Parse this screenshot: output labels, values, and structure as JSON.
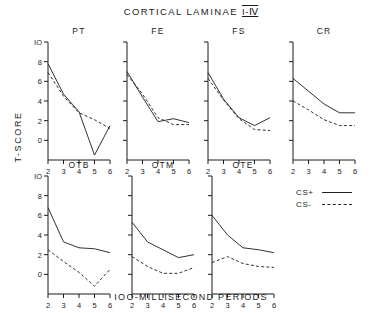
{
  "figure": {
    "title_main": "CORTICAL LAMINAE",
    "title_roman": "I-Ⅳ",
    "ylabel": "T-SCORE",
    "xlabel": "IOO-MILLISECOND PERIODS"
  },
  "legend": {
    "position": "right-middle",
    "entries": [
      {
        "key": "CS+",
        "style": "solid"
      },
      {
        "key": "CS-",
        "style": "dashed"
      }
    ]
  },
  "chart_data": {
    "type": "line",
    "xlabel": "IOO-MILLISECOND PERIODS",
    "ylabel": "T-SCORE",
    "x": [
      2,
      3,
      4,
      5,
      6
    ],
    "xticks": [
      "2",
      "3",
      "4",
      "5",
      "6"
    ],
    "xlim": [
      2,
      6
    ],
    "yticks": [
      "0",
      "2",
      "4",
      "6",
      "8",
      "IO"
    ],
    "ytick_values": [
      0,
      2,
      4,
      6,
      8,
      10
    ],
    "ylim": [
      -2,
      10
    ],
    "grid": false,
    "legend": [
      "CS+",
      "CS-"
    ],
    "panel_layout": [
      4,
      3
    ],
    "panels": [
      {
        "name": "PT",
        "row": 0,
        "axis_labels": true,
        "series": [
          {
            "name": "CS+",
            "style": "solid",
            "values": [
              7.8,
              4.7,
              2.9,
              -1.5,
              1.5
            ]
          },
          {
            "name": "CS-",
            "style": "dashed",
            "values": [
              6.9,
              4.5,
              2.8,
              2.1,
              1.2
            ]
          }
        ]
      },
      {
        "name": "FE",
        "row": 0,
        "axis_labels": false,
        "series": [
          {
            "name": "CS+",
            "style": "solid",
            "values": [
              7.0,
              4.4,
              1.9,
              2.2,
              1.8
            ]
          },
          {
            "name": "CS-",
            "style": "dashed",
            "values": [
              6.7,
              4.7,
              2.3,
              1.6,
              1.6
            ]
          }
        ]
      },
      {
        "name": "FS",
        "row": 0,
        "axis_labels": false,
        "series": [
          {
            "name": "CS+",
            "style": "solid",
            "values": [
              6.9,
              4.2,
              2.3,
              1.5,
              2.3
            ]
          },
          {
            "name": "CS-",
            "style": "dashed",
            "values": [
              6.3,
              4.1,
              2.2,
              1.1,
              1.0
            ]
          }
        ]
      },
      {
        "name": "CR",
        "row": 0,
        "axis_labels": false,
        "series": [
          {
            "name": "CS+",
            "style": "solid",
            "values": [
              6.3,
              5.0,
              3.7,
              2.8,
              2.8
            ]
          },
          {
            "name": "CS-",
            "style": "dashed",
            "values": [
              4.0,
              3.1,
              2.1,
              1.5,
              1.5
            ]
          }
        ]
      },
      {
        "name": "OTB",
        "row": 1,
        "axis_labels": true,
        "series": [
          {
            "name": "CS+",
            "style": "solid",
            "values": [
              6.8,
              3.3,
              2.7,
              2.6,
              2.2
            ]
          },
          {
            "name": "CS-",
            "style": "dashed",
            "values": [
              2.5,
              1.3,
              0.2,
              -1.2,
              0.5
            ]
          }
        ]
      },
      {
        "name": "OTM",
        "row": 1,
        "axis_labels": false,
        "series": [
          {
            "name": "CS+",
            "style": "solid",
            "values": [
              5.3,
              3.3,
              2.5,
              1.7,
              2.0
            ]
          },
          {
            "name": "CS-",
            "style": "dashed",
            "values": [
              1.8,
              0.8,
              0.1,
              0.1,
              0.7
            ]
          }
        ]
      },
      {
        "name": "OTE",
        "row": 1,
        "axis_labels": false,
        "series": [
          {
            "name": "CS+",
            "style": "solid",
            "values": [
              6.0,
              4.0,
              2.7,
              2.5,
              2.2
            ]
          },
          {
            "name": "CS-",
            "style": "dashed",
            "values": [
              1.2,
              1.8,
              1.1,
              0.8,
              0.7
            ]
          }
        ]
      }
    ]
  },
  "colors": {
    "ink": "#1b1b1b",
    "background": "#ffffff"
  }
}
